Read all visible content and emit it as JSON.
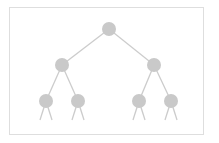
{
  "diagram": {
    "type": "binary-tree",
    "title": "",
    "colors": {
      "node": "#c9c9c9",
      "edge": "#cccccc",
      "frame": "#dedede"
    },
    "nodes": [
      {
        "id": "root",
        "level": 0,
        "label": ""
      },
      {
        "id": "l",
        "level": 1,
        "parent": "root",
        "label": ""
      },
      {
        "id": "r",
        "level": 1,
        "parent": "root",
        "label": ""
      },
      {
        "id": "ll",
        "level": 2,
        "parent": "l",
        "label": ""
      },
      {
        "id": "lr",
        "level": 2,
        "parent": "l",
        "label": ""
      },
      {
        "id": "rl",
        "level": 2,
        "parent": "r",
        "label": ""
      },
      {
        "id": "rr",
        "level": 2,
        "parent": "r",
        "label": ""
      }
    ],
    "leaf_continuation_stubs": true
  }
}
